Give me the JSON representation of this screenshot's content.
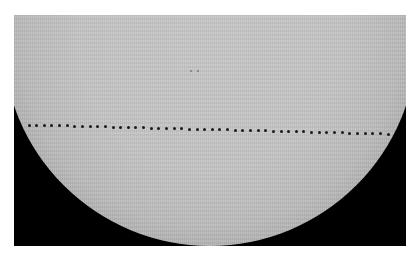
{
  "image": {
    "subject": "solar disk with transit track",
    "frame": {
      "x": 14,
      "y": 15,
      "width": 392,
      "height": 231,
      "background": "#000000"
    },
    "sun": {
      "center_x": 196,
      "center_y": 24,
      "radius": 207,
      "color": "#c6c6c6",
      "limb_color": "#111111"
    },
    "sunspots": [
      {
        "x": 176,
        "y": 55
      },
      {
        "x": 183,
        "y": 55
      }
    ],
    "transit_track": {
      "start": {
        "x": 15,
        "y": 110
      },
      "end": {
        "x": 374,
        "y": 119
      },
      "dot_count": 48,
      "dot_color": "#1a1a1a"
    }
  }
}
